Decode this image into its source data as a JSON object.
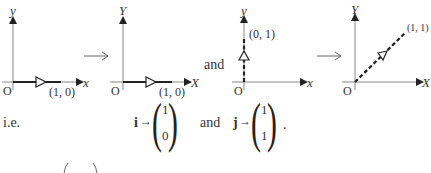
{
  "figure": {
    "diagrams": [
      {
        "id": "i-before",
        "x_axis_label": "x",
        "y_axis_label": "y",
        "origin_label": "O",
        "point_label": "(1, 0)",
        "vector_style": "solid"
      },
      {
        "id": "i-after",
        "x_axis_label": "X",
        "y_axis_label": "Y",
        "origin_label": "O",
        "point_label": "(1, 0)",
        "vector_style": "solid"
      },
      {
        "id": "j-before",
        "x_axis_label": "x",
        "y_axis_label": "y",
        "origin_label": "O",
        "point_label": "(0, 1)",
        "vector_style": "dashed"
      },
      {
        "id": "j-after",
        "x_axis_label": "X",
        "y_axis_label": "Y",
        "origin_label": "O",
        "point_label": "(1, 1)",
        "vector_style": "dashed"
      }
    ],
    "maps_to_symbol": "⟶",
    "connector": "and"
  },
  "equation": {
    "prefix": "i.e.",
    "i_symbol": "i",
    "j_symbol": "j",
    "arrow": "→",
    "i_image": [
      "1",
      "0"
    ],
    "j_image": [
      "1",
      "1"
    ],
    "connector": "and",
    "terminator": "."
  }
}
